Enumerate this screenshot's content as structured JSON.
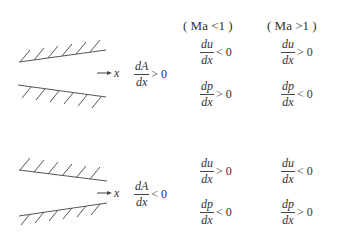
{
  "headers": {
    "subsonic": "( Ma <1 )",
    "supersonic": "( Ma >1 )"
  },
  "axis_label": "x",
  "rows": [
    {
      "name": "diverging",
      "area": {
        "num": "dA",
        "den": "dx",
        "rel": "> 0"
      },
      "subsonic": [
        {
          "num": "du",
          "den": "dx",
          "rel": "< 0"
        },
        {
          "num": "dp",
          "den": "dx",
          "rel": "> 0"
        }
      ],
      "supersonic": [
        {
          "num": "du",
          "den": "dx",
          "rel": "> 0"
        },
        {
          "num": "dp",
          "den": "dx",
          "rel": "< 0"
        }
      ]
    },
    {
      "name": "converging",
      "area": {
        "num": "dA",
        "den": "dx",
        "rel": "< 0"
      },
      "subsonic": [
        {
          "num": "du",
          "den": "dx",
          "rel": "> 0"
        },
        {
          "num": "dp",
          "den": "dx",
          "rel": "< 0"
        }
      ],
      "supersonic": [
        {
          "num": "du",
          "den": "dx",
          "rel": "< 0"
        },
        {
          "num": "dp",
          "den": "dx",
          "rel": "> 0"
        }
      ]
    }
  ],
  "colors": {
    "line": "#444444",
    "text": "#333333",
    "background": "#ffffff"
  }
}
